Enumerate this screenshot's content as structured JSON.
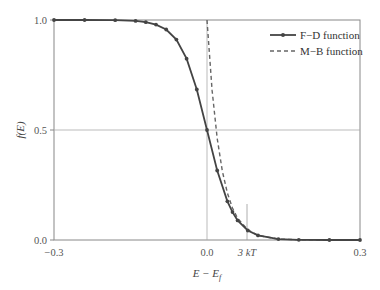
{
  "chart_data": {
    "type": "line",
    "title": "",
    "xlabel": "E − E_f",
    "ylabel": "f(E)",
    "xlim": [
      -0.3,
      0.3
    ],
    "ylim": [
      0.0,
      1.0
    ],
    "x_ticks": [
      "-0.3",
      "0.0",
      "3 kT",
      "0.3"
    ],
    "y_ticks": [
      "0.0",
      "0.5",
      "1.0"
    ],
    "grid": "horizontal line at 0.5, vertical line at 0.0",
    "legend_position": "upper right",
    "kT": 0.0259,
    "annotations": [
      {
        "text": "3 kT",
        "x": 0.078
      }
    ],
    "series": [
      {
        "name": "F−D function",
        "style": "solid with markers",
        "color": "#444444",
        "x": [
          -0.3,
          -0.24,
          -0.18,
          -0.14,
          -0.12,
          -0.1,
          -0.08,
          -0.06,
          -0.04,
          -0.02,
          0.0,
          0.02,
          0.04,
          0.05,
          0.06,
          0.08,
          0.1,
          0.14,
          0.18,
          0.24,
          0.3
        ],
        "values": [
          1.0,
          1.0,
          0.999,
          0.996,
          0.99,
          0.979,
          0.957,
          0.911,
          0.824,
          0.684,
          0.5,
          0.316,
          0.176,
          0.127,
          0.089,
          0.043,
          0.021,
          0.004,
          0.001,
          0.0,
          0.0
        ]
      },
      {
        "name": "M−B function",
        "style": "dashed",
        "color": "#666666",
        "x": [
          0.0,
          0.01,
          0.02,
          0.03,
          0.04,
          0.05,
          0.06,
          0.08,
          0.1,
          0.14,
          0.18,
          0.24,
          0.3
        ],
        "values": [
          1.0,
          0.68,
          0.462,
          0.314,
          0.213,
          0.145,
          0.099,
          0.046,
          0.021,
          0.004,
          0.001,
          0.0,
          0.0
        ]
      }
    ]
  },
  "legend": {
    "fd_label": "F−D function",
    "mb_label": "M−B function"
  },
  "axes": {
    "y_title": "f(E)",
    "x_title": "E − E",
    "x_title_sub": "f",
    "tick_y_0": "0.0",
    "tick_y_05": "0.5",
    "tick_y_1": "1.0",
    "tick_x_neg": "−0.3",
    "tick_x_0": "0.0",
    "tick_x_3kt": "3 kT",
    "tick_x_pos": "0.3"
  }
}
